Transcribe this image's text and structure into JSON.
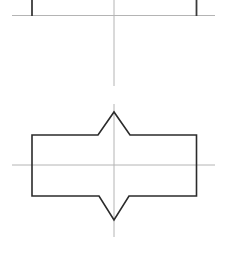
{
  "canvas": {
    "width": 225,
    "height": 265,
    "background": "#ffffff"
  },
  "style": {
    "outline_color": "#2b2b2b",
    "outline_width": 1.6,
    "centerline_color": "#b4b4b4",
    "centerline_width": 1.0,
    "top_view_edge_color": "#3a3a3a",
    "top_view_edge_width": 1.8
  },
  "views": {
    "top_view": {
      "name": "top-view",
      "horizontal_edge": {
        "x1": 12,
        "y1": 15.5,
        "x2": 215,
        "y2": 15.5
      },
      "vertical_edges": [
        {
          "x1": 32,
          "y1": 0,
          "x2": 32,
          "y2": 16
        },
        {
          "x1": 196.5,
          "y1": 0,
          "x2": 196.5,
          "y2": 16
        }
      ]
    },
    "front_view": {
      "name": "front-view",
      "outline_points": "32,135 98,135 114,112 130,135 196.5,135 196.5,196 129,196 114,220 99,196 32,196",
      "rect_left": 32,
      "rect_right": 196.5,
      "rect_top": 135,
      "rect_bottom": 196,
      "top_notch_apex": {
        "x": 114,
        "y": 112
      },
      "top_notch_left_shoulder": {
        "x": 98,
        "y": 135
      },
      "top_notch_right_shoulder": {
        "x": 130,
        "y": 135
      },
      "bottom_notch_vertex": {
        "x": 114,
        "y": 220
      },
      "bottom_notch_left_shoulder": {
        "x": 99,
        "y": 196
      },
      "bottom_notch_right_shoulder": {
        "x": 129,
        "y": 196
      }
    }
  },
  "centerlines": {
    "vertical_upper": {
      "x1": 114,
      "y1": 0,
      "x2": 114,
      "y2": 86
    },
    "vertical_lower": {
      "x1": 114,
      "y1": 104,
      "x2": 114,
      "y2": 237
    },
    "horizontal_front": {
      "x1": 12,
      "y1": 165,
      "x2": 215,
      "y2": 165
    }
  },
  "labels": {
    "dimensions": [],
    "annotations": []
  }
}
